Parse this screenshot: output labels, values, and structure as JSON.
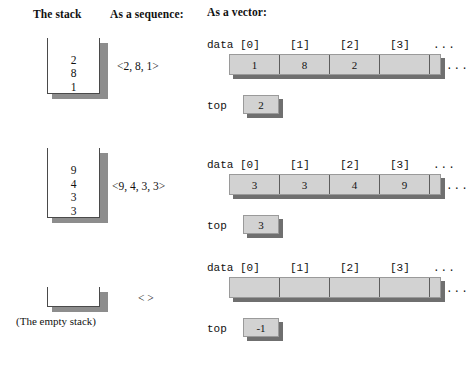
{
  "headers": {
    "stack": "The stack",
    "sequence": "As a sequence:",
    "vector": "As a vector:"
  },
  "labels": {
    "data": "data",
    "top": "top",
    "ellipsis": "...",
    "empty_stack_caption": "(The empty stack)"
  },
  "indices": [
    "[0]",
    "[1]",
    "[2]",
    "[3]"
  ],
  "colors": {
    "cell_fill": "#d2d2d2",
    "cell_border": "#9a9a9a",
    "divider": "#5d5d5d",
    "shadow": "#6f6f6f",
    "stack_wall": "#4a4a4a",
    "stack_shadow": "#8d8d8d",
    "background": "#ffffff",
    "text": "#111111"
  },
  "rows": [
    {
      "name": "row-three-elements",
      "stack_items": [
        "2",
        "8",
        "1"
      ],
      "sequence": "<2, 8, 1>",
      "vector_cells": [
        "1",
        "8",
        "2",
        ""
      ],
      "top_value": "2",
      "empty": false
    },
    {
      "name": "row-four-elements",
      "stack_items": [
        "9",
        "4",
        "3",
        "3"
      ],
      "sequence": "<9, 4, 3, 3>",
      "vector_cells": [
        "3",
        "3",
        "4",
        "9"
      ],
      "top_value": "3",
      "empty": false
    },
    {
      "name": "row-empty-stack",
      "stack_items": [],
      "sequence": "< >",
      "vector_cells": [
        "",
        "",
        "",
        ""
      ],
      "top_value": "-1",
      "empty": true
    }
  ]
}
